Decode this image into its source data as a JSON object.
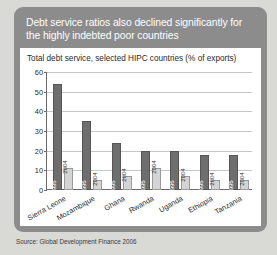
{
  "card": {
    "title": "Debt service ratios also declined significantly for the highly indebted poor countries",
    "subtitle": "Total debt service, selected HIPC countries (% of exports)",
    "source": "Source: Global Development Finance 2006"
  },
  "colors": {
    "page_background": "#d9d9d6",
    "card_background": "#8c8c8c",
    "panel_background": "#ffffff",
    "title_text": "#ffffff",
    "series_1995": "#6e6e6e",
    "series_2004": "#d4d4d4",
    "gridline": "#c6c6c6",
    "axis": "#6b6b6b"
  },
  "chart_data": {
    "type": "bar",
    "title": "Total debt service, selected HIPC countries (% of exports)",
    "xlabel": "",
    "ylabel": "",
    "ylim": [
      0,
      60
    ],
    "yticks": [
      0,
      10,
      20,
      30,
      40,
      50,
      60
    ],
    "ytick_labels": [
      "0",
      "10",
      "20",
      "30",
      "40",
      "50",
      "60"
    ],
    "grid": true,
    "legend": "in-bar labels",
    "categories": [
      "Sierra Leone",
      "Mozambique",
      "Ghana",
      "Rwanda",
      "Uganda",
      "Ethiopia",
      "Tanzania"
    ],
    "series": [
      {
        "name": "1995",
        "values": [
          54,
          35,
          24,
          19.7,
          19.6,
          18,
          18
        ]
      },
      {
        "name": "2004",
        "values": [
          11,
          5,
          7,
          11,
          7,
          5,
          5
        ]
      }
    ],
    "bar_labels_1995": [
      "1995",
      "1995",
      "1995",
      "1995",
      "1995",
      "1995",
      "1995"
    ],
    "bar_labels_2004": [
      "2004",
      "2004",
      "2004",
      "2004",
      "2004",
      "2004",
      "2004"
    ]
  }
}
